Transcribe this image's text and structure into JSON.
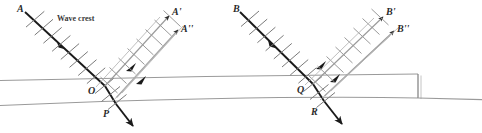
{
  "figure": {
    "name": "wave-refraction-reflection-diagram",
    "background": "#ffffff",
    "width": 482,
    "height": 133,
    "colors": {
      "incident_ray": "#1a1a1a",
      "reflected_ray": "#8c8c8c",
      "crest_tick": "#8c8c8c",
      "incident_crest_tick": "#6b6b6b",
      "slab_boundary": "#9a9a9a",
      "label_text": "#2a2a2a"
    }
  },
  "annotations": {
    "wave_crest_label": "Wave crest"
  },
  "diagrams": [
    {
      "id": "left",
      "incident_ray_label": "A",
      "reflected_ray_labels": [
        "A'",
        "A''"
      ],
      "point_labels": [
        "O",
        "P"
      ],
      "entry_point": "O",
      "exit_point": "P"
    },
    {
      "id": "right",
      "incident_ray_label": "B",
      "reflected_ray_labels": [
        "B'",
        "B''"
      ],
      "point_labels": [
        "Q",
        "R"
      ],
      "entry_point": "Q",
      "exit_point": "R"
    }
  ],
  "slab": {
    "top_boundary_label": "",
    "bottom_boundary_label": "",
    "right_edge_visible": true
  }
}
